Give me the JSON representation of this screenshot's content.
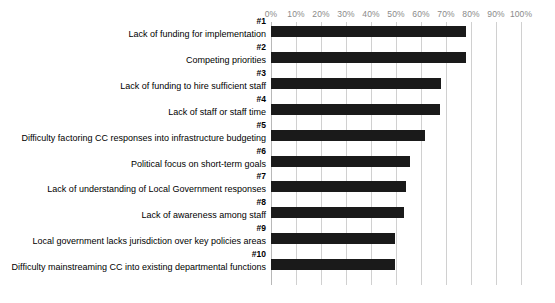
{
  "chart_data": {
    "type": "bar",
    "orientation": "horizontal",
    "title": "",
    "xlabel": "",
    "ylabel": "",
    "xlim": [
      0,
      100
    ],
    "grid": true,
    "legend": false,
    "bar_color": "#1a1a1a",
    "gridline_color": "#d0d0d0",
    "tick_label_color": "#8a8a8a",
    "x_ticks": [
      "0%",
      "10%",
      "20%",
      "30%",
      "40%",
      "50%",
      "60%",
      "70%",
      "80%",
      "90%",
      "100%"
    ],
    "x_tick_values": [
      0,
      10,
      20,
      30,
      40,
      50,
      60,
      70,
      80,
      90,
      100
    ],
    "ranks": [
      "#1",
      "#2",
      "#3",
      "#4",
      "#5",
      "#6",
      "#7",
      "#8",
      "#9",
      "#10"
    ],
    "categories": [
      "Lack of funding for implementation",
      "Competing priorities",
      "Lack of funding to hire sufficient staff",
      "Lack of staff or staff time",
      "Difficulty factoring CC responses into infrastructure budgeting",
      "Political focus on short-term goals",
      "Lack of understanding of Local Government responses",
      "Lack of awareness among staff",
      "Local government lacks jurisdiction over key policies areas",
      "Difficulty mainstreaming CC into existing departmental functions"
    ],
    "values": [
      78,
      78,
      68,
      67.5,
      61.5,
      55.5,
      54,
      53,
      49.5,
      49.5
    ]
  }
}
